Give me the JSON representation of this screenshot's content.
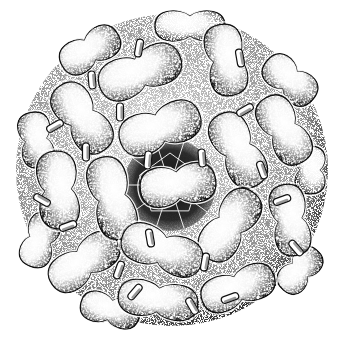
{
  "image": {
    "subject": "stippled illustration of a spherical virus capsid",
    "background": "#ffffff",
    "ink": "#111111",
    "width": 343,
    "height": 341
  },
  "capsid": {
    "center": [
      172,
      170
    ],
    "radius": 156,
    "central_opening": {
      "cx": 170,
      "cy": 185,
      "r": 46,
      "shape": "pentagonal pore with web-like ridges"
    },
    "dimers": [
      {
        "cx": 178,
        "cy": 185,
        "w": 76,
        "h": 44,
        "rot": -8,
        "z": 3
      },
      {
        "cx": 160,
        "cy": 128,
        "w": 84,
        "h": 46,
        "rot": -20,
        "z": 3
      },
      {
        "cx": 238,
        "cy": 150,
        "w": 80,
        "h": 44,
        "rot": 62,
        "z": 3
      },
      {
        "cx": 230,
        "cy": 225,
        "w": 80,
        "h": 44,
        "rot": -55,
        "z": 3
      },
      {
        "cx": 112,
        "cy": 198,
        "w": 84,
        "h": 44,
        "rot": 75,
        "z": 3
      },
      {
        "cx": 162,
        "cy": 250,
        "w": 84,
        "h": 44,
        "rot": 20,
        "z": 3
      },
      {
        "cx": 226,
        "cy": 60,
        "w": 72,
        "h": 42,
        "rot": 80,
        "z": 2
      },
      {
        "cx": 140,
        "cy": 72,
        "w": 86,
        "h": 46,
        "rot": -22,
        "z": 2
      },
      {
        "cx": 82,
        "cy": 118,
        "w": 78,
        "h": 44,
        "rot": 55,
        "z": 2
      },
      {
        "cx": 58,
        "cy": 190,
        "w": 78,
        "h": 44,
        "rot": 85,
        "z": 2
      },
      {
        "cx": 84,
        "cy": 262,
        "w": 78,
        "h": 42,
        "rot": -35,
        "z": 2
      },
      {
        "cx": 158,
        "cy": 300,
        "w": 80,
        "h": 40,
        "rot": 8,
        "z": 2
      },
      {
        "cx": 238,
        "cy": 288,
        "w": 76,
        "h": 40,
        "rot": -20,
        "z": 2
      },
      {
        "cx": 290,
        "cy": 220,
        "w": 72,
        "h": 40,
        "rot": 80,
        "z": 2
      },
      {
        "cx": 284,
        "cy": 130,
        "w": 74,
        "h": 42,
        "rot": 60,
        "z": 2
      },
      {
        "cx": 290,
        "cy": 80,
        "w": 60,
        "h": 38,
        "rot": 40,
        "z": 1
      },
      {
        "cx": 90,
        "cy": 50,
        "w": 64,
        "h": 38,
        "rot": -30,
        "z": 1
      },
      {
        "cx": 36,
        "cy": 140,
        "w": 56,
        "h": 36,
        "rot": 80,
        "z": 1
      },
      {
        "cx": 40,
        "cy": 240,
        "w": 56,
        "h": 36,
        "rot": -70,
        "z": 1
      },
      {
        "cx": 110,
        "cy": 310,
        "w": 60,
        "h": 34,
        "rot": 15,
        "z": 1
      },
      {
        "cx": 300,
        "cy": 270,
        "w": 52,
        "h": 34,
        "rot": -50,
        "z": 1
      },
      {
        "cx": 310,
        "cy": 170,
        "w": 48,
        "h": 34,
        "rot": 90,
        "z": 1
      },
      {
        "cx": 190,
        "cy": 26,
        "w": 70,
        "h": 34,
        "rot": 0,
        "z": 1
      }
    ],
    "spikes": [
      {
        "x": 139,
        "y": 48,
        "rot": 10
      },
      {
        "x": 240,
        "y": 58,
        "rot": -10
      },
      {
        "x": 120,
        "y": 112,
        "rot": 0
      },
      {
        "x": 92,
        "y": 80,
        "rot": -5
      },
      {
        "x": 148,
        "y": 160,
        "rot": 5
      },
      {
        "x": 202,
        "y": 158,
        "rot": -5
      },
      {
        "x": 245,
        "y": 110,
        "rot": 60
      },
      {
        "x": 55,
        "y": 126,
        "rot": 60
      },
      {
        "x": 86,
        "y": 152,
        "rot": 0
      },
      {
        "x": 262,
        "y": 170,
        "rot": -20
      },
      {
        "x": 282,
        "y": 200,
        "rot": 70
      },
      {
        "x": 205,
        "y": 262,
        "rot": 10
      },
      {
        "x": 150,
        "y": 238,
        "rot": -10
      },
      {
        "x": 119,
        "y": 270,
        "rot": 20
      },
      {
        "x": 230,
        "y": 298,
        "rot": 70
      },
      {
        "x": 68,
        "y": 226,
        "rot": 70
      },
      {
        "x": 192,
        "y": 306,
        "rot": -30
      },
      {
        "x": 135,
        "y": 292,
        "rot": 40
      },
      {
        "x": 296,
        "y": 248,
        "rot": -40
      },
      {
        "x": 42,
        "y": 200,
        "rot": -60
      }
    ]
  }
}
